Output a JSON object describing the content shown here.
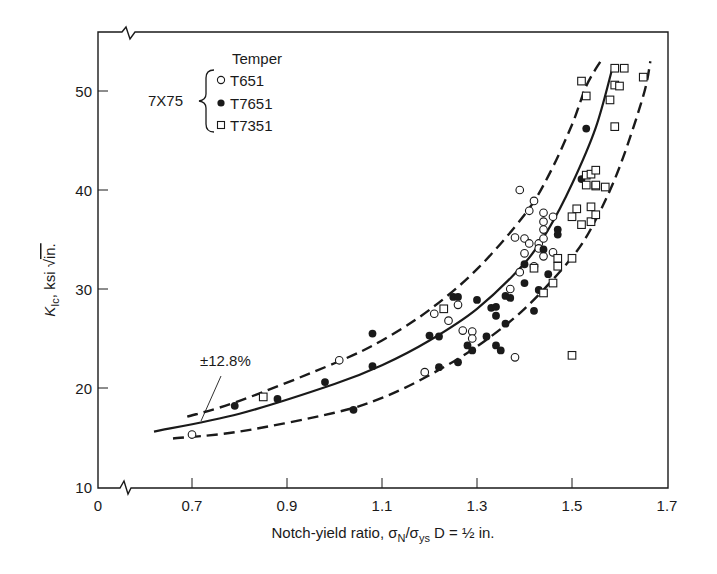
{
  "chart_data": {
    "type": "scatter",
    "title": "",
    "xlabel": "Notch-yield ratio, σN/σys D = ½ in.",
    "xlabel_parts": {
      "pre": "Notch-yield ratio, σ",
      "sub1": "N",
      "mid": "/σ",
      "sub2": "ys",
      "post": " D = ½ in."
    },
    "ylabel": "KIc, ksi √in.",
    "ylabel_parts": {
      "k": "K",
      "sub": "Ic",
      "post": ", ksi ",
      "root": "√",
      "unit": "in."
    },
    "x_ticks": [
      "0",
      "0.7",
      "0.9",
      "1.1",
      "1.3",
      "1.5",
      "1.7"
    ],
    "x_tick_values": [
      0.7,
      0.9,
      1.1,
      1.3,
      1.5,
      1.7
    ],
    "y_ticks": [
      "10",
      "20",
      "30",
      "40",
      "50"
    ],
    "y_tick_values": [
      10,
      20,
      30,
      40,
      50
    ],
    "xlim": [
      0.6,
      1.7
    ],
    "ylim": [
      10,
      55.5
    ],
    "axis_breaks": [
      "x-axis break near origin",
      "top border break near origin"
    ],
    "grid": false,
    "legend": {
      "title": "Temper",
      "group_label": "7X75",
      "position": "upper-left",
      "entries": [
        {
          "name": "T651",
          "marker": "open-circle"
        },
        {
          "name": "T7651",
          "marker": "filled-circle"
        },
        {
          "name": "T7351",
          "marker": "open-square"
        }
      ]
    },
    "annotation": {
      "text": "±12.8%",
      "points_to": "upper scatter band curve"
    },
    "series": [
      {
        "name": "T651",
        "marker": "open-circle",
        "points": [
          [
            0.7,
            15.3
          ],
          [
            1.01,
            22.8
          ],
          [
            1.19,
            21.6
          ],
          [
            1.21,
            27.5
          ],
          [
            1.24,
            26.8
          ],
          [
            1.26,
            28.4
          ],
          [
            1.27,
            25.8
          ],
          [
            1.29,
            25.7
          ],
          [
            1.29,
            25.0
          ],
          [
            1.39,
            31.7
          ],
          [
            1.42,
            32.3
          ],
          [
            1.44,
            33.3
          ],
          [
            1.46,
            33.7
          ],
          [
            1.37,
            30.0
          ],
          [
            1.39,
            40.0
          ],
          [
            1.42,
            38.9
          ],
          [
            1.41,
            37.9
          ],
          [
            1.44,
            37.7
          ],
          [
            1.46,
            37.3
          ],
          [
            1.44,
            36.8
          ],
          [
            1.44,
            36.0
          ],
          [
            1.38,
            35.2
          ],
          [
            1.4,
            35.1
          ],
          [
            1.41,
            34.6
          ],
          [
            1.43,
            34.6
          ],
          [
            1.44,
            35.1
          ],
          [
            1.4,
            33.6
          ],
          [
            1.38,
            23.1
          ],
          [
            1.43,
            34.1
          ]
        ]
      },
      {
        "name": "T7651",
        "marker": "filled-circle",
        "points": [
          [
            0.79,
            18.2
          ],
          [
            0.88,
            18.9
          ],
          [
            0.98,
            20.6
          ],
          [
            1.04,
            17.8
          ],
          [
            1.08,
            25.5
          ],
          [
            1.08,
            22.2
          ],
          [
            1.2,
            25.3
          ],
          [
            1.22,
            25.2
          ],
          [
            1.22,
            22.1
          ],
          [
            1.25,
            29.2
          ],
          [
            1.26,
            29.2
          ],
          [
            1.26,
            22.6
          ],
          [
            1.28,
            24.3
          ],
          [
            1.29,
            23.8
          ],
          [
            1.3,
            28.9
          ],
          [
            1.32,
            25.2
          ],
          [
            1.33,
            28.1
          ],
          [
            1.34,
            28.2
          ],
          [
            1.34,
            27.3
          ],
          [
            1.36,
            26.5
          ],
          [
            1.36,
            29.3
          ],
          [
            1.37,
            29.1
          ],
          [
            1.4,
            30.6
          ],
          [
            1.43,
            29.9
          ],
          [
            1.4,
            32.5
          ],
          [
            1.42,
            27.8
          ],
          [
            1.45,
            31.5
          ],
          [
            1.44,
            34.0
          ],
          [
            1.47,
            36.0
          ],
          [
            1.47,
            35.5
          ],
          [
            1.52,
            41.1
          ],
          [
            1.53,
            46.2
          ],
          [
            1.34,
            24.3
          ],
          [
            1.35,
            23.8
          ]
        ]
      },
      {
        "name": "T7351",
        "marker": "open-square",
        "points": [
          [
            0.85,
            19.1
          ],
          [
            1.23,
            28.0
          ],
          [
            1.42,
            32.1
          ],
          [
            1.44,
            29.6
          ],
          [
            1.47,
            33.1
          ],
          [
            1.47,
            32.3
          ],
          [
            1.46,
            30.6
          ],
          [
            1.5,
            33.1
          ],
          [
            1.51,
            38.1
          ],
          [
            1.54,
            38.3
          ],
          [
            1.5,
            37.3
          ],
          [
            1.52,
            36.5
          ],
          [
            1.54,
            36.8
          ],
          [
            1.55,
            37.5
          ],
          [
            1.55,
            40.4
          ],
          [
            1.53,
            41.5
          ],
          [
            1.54,
            41.6
          ],
          [
            1.53,
            40.5
          ],
          [
            1.55,
            40.5
          ],
          [
            1.57,
            40.3
          ],
          [
            1.55,
            42.0
          ],
          [
            1.52,
            51.0
          ],
          [
            1.53,
            49.5
          ],
          [
            1.58,
            49.1
          ],
          [
            1.59,
            46.4
          ],
          [
            1.59,
            50.6
          ],
          [
            1.6,
            50.5
          ],
          [
            1.59,
            52.3
          ],
          [
            1.61,
            52.3
          ],
          [
            1.65,
            51.4
          ],
          [
            1.5,
            23.3
          ]
        ]
      }
    ],
    "curves": [
      {
        "name": "mean-fit",
        "style": "solid",
        "points": [
          [
            0.62,
            15.6
          ],
          [
            0.8,
            17.4
          ],
          [
            1.0,
            20.4
          ],
          [
            1.1,
            22.3
          ],
          [
            1.2,
            24.8
          ],
          [
            1.3,
            28.0
          ],
          [
            1.4,
            32.6
          ],
          [
            1.45,
            36.0
          ],
          [
            1.5,
            40.6
          ],
          [
            1.55,
            46.3
          ],
          [
            1.585,
            52.3
          ]
        ]
      },
      {
        "name": "upper-band (+12.8%)",
        "style": "dashed",
        "points": [
          [
            0.69,
            17.1
          ],
          [
            0.8,
            18.7
          ],
          [
            1.0,
            22.5
          ],
          [
            1.1,
            24.8
          ],
          [
            1.2,
            27.9
          ],
          [
            1.3,
            32.0
          ],
          [
            1.4,
            37.5
          ],
          [
            1.45,
            41.4
          ],
          [
            1.5,
            46.6
          ],
          [
            1.53,
            50.5
          ],
          [
            1.56,
            53.0
          ]
        ]
      },
      {
        "name": "lower-band (-12.8%)",
        "style": "dashed",
        "points": [
          [
            0.66,
            14.9
          ],
          [
            0.8,
            15.6
          ],
          [
            1.0,
            17.5
          ],
          [
            1.1,
            19.0
          ],
          [
            1.2,
            21.3
          ],
          [
            1.3,
            24.2
          ],
          [
            1.4,
            28.0
          ],
          [
            1.5,
            33.2
          ],
          [
            1.55,
            37.0
          ],
          [
            1.6,
            42.3
          ],
          [
            1.65,
            49.5
          ],
          [
            1.665,
            53.0
          ]
        ]
      }
    ]
  }
}
